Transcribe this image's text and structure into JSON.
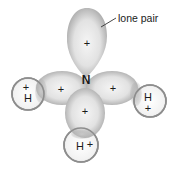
{
  "diagram": {
    "molecule": "NH3",
    "central_atom": {
      "label": "N"
    },
    "annotation": {
      "label": "lone pair"
    },
    "lobes": [
      {
        "id": "lone-pair-lobe",
        "charge": "+"
      },
      {
        "id": "left-bond-lobe",
        "charge": "+"
      },
      {
        "id": "right-bond-lobe",
        "charge": "+"
      },
      {
        "id": "bottom-bond-lobe",
        "charge": "+"
      }
    ],
    "hydrogens": [
      {
        "id": "left-h",
        "label": "H",
        "charge": "+"
      },
      {
        "id": "right-h",
        "label": "H",
        "charge": "+"
      },
      {
        "id": "bottom-h",
        "label": "H",
        "charge": "+"
      }
    ],
    "colors": {
      "lobe_fill_center": "#f4f4f4",
      "lobe_fill_edge": "#a8a8a8",
      "h_circle_stroke": "#8a8a8a",
      "text": "#1a1a1a"
    }
  }
}
